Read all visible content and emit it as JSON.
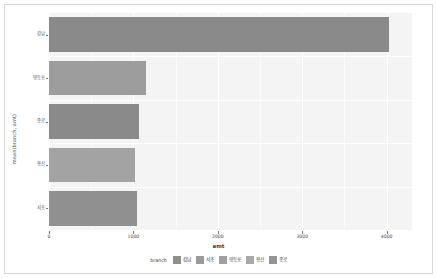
{
  "chart_data": {
    "type": "bar",
    "orientation": "horizontal",
    "title": "",
    "xlabel": "amt",
    "ylabel": "mean(branch, amt)",
    "xlim": [
      0,
      4300
    ],
    "ylim": [
      0,
      5
    ],
    "grid": true,
    "legend_position": "bottom",
    "legend_title": "branch",
    "categories": [
      "강남",
      "영등포",
      "종로",
      "용산",
      "서초"
    ],
    "values": [
      4033,
      1144,
      1067,
      1022,
      1044
    ],
    "xticks": [
      0,
      1000,
      2000,
      3000,
      4000
    ],
    "xtick_labels": [
      "0",
      "1000",
      "2000",
      "3000",
      "4000"
    ],
    "bars": [
      {
        "label": "강남",
        "value": 4033,
        "color": "#8a8a8a"
      },
      {
        "label": "영등포",
        "value": 1144,
        "color": "#9d9d9d"
      },
      {
        "label": "종로",
        "value": 1067,
        "color": "#8a8a8a"
      },
      {
        "label": "용산",
        "value": 1022,
        "color": "#a3a3a3"
      },
      {
        "label": "서초",
        "value": 1044,
        "color": "#909090"
      }
    ],
    "legend_entries": [
      {
        "label": "강남",
        "color": "#8f8f8f"
      },
      {
        "label": "서초",
        "color": "#9b9b9b"
      },
      {
        "label": "영등포",
        "color": "#a0a0a0"
      },
      {
        "label": "용산",
        "color": "#a8a8a8"
      },
      {
        "label": "종로",
        "color": "#949494"
      }
    ],
    "panel_background": "#f4f4f4",
    "grid_color": "#ffffff",
    "figure_background": "#ffffff"
  },
  "axes": {
    "y_tick_labels": [
      "강남",
      "영등포",
      "종로",
      "용산",
      "서초"
    ],
    "x_tick_labels": [
      "0",
      "1000",
      "2000",
      "3000",
      "4000"
    ],
    "x_axis_title": "amt",
    "y_axis_title": "mean(branch, amt)"
  },
  "legend": {
    "title": "branch",
    "items": [
      "강남",
      "서초",
      "영등포",
      "용산",
      "종로"
    ]
  }
}
